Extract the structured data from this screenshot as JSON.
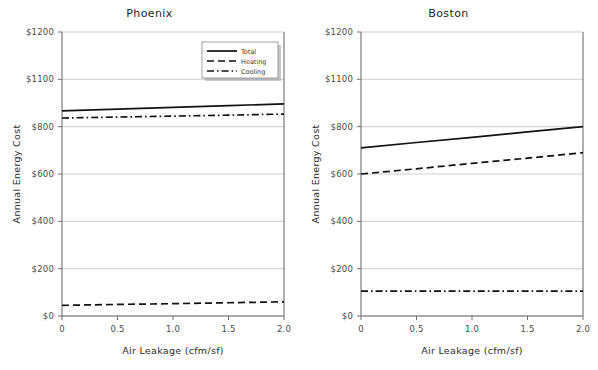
{
  "chart_data": [
    {
      "type": "line",
      "title": "Phoenix",
      "xlabel": "Air Leakage (cfm/sf)",
      "ylabel": "Annual Energy Cost",
      "x": [
        0,
        0.5,
        1.0,
        1.5,
        2.0
      ],
      "xlim": [
        0,
        2.0
      ],
      "xticks": [
        0,
        0.5,
        1.0,
        1.5,
        2.0
      ],
      "xticklabels": [
        "0",
        "0.5",
        "1.0",
        "1.5",
        "2.0"
      ],
      "yticks": [
        1200,
        1100,
        800,
        600,
        400,
        200,
        0
      ],
      "yticklabels": [
        "$1200",
        "$1100",
        "$800",
        "$600",
        "$400",
        "$200",
        "$0"
      ],
      "grid": true,
      "legend": "upper right",
      "series": [
        {
          "name": "Total",
          "style": "solid",
          "values": [
            900,
            911,
            922,
            933,
            945
          ]
        },
        {
          "name": "Heating",
          "style": "dashed",
          "values": [
            45,
            49,
            52,
            56,
            60
          ]
        },
        {
          "name": "Cooling",
          "style": "dashdot",
          "values": [
            855,
            861,
            867,
            873,
            880
          ]
        }
      ]
    },
    {
      "type": "line",
      "title": "Boston",
      "xlabel": "Air Leakage (cfm/sf)",
      "ylabel": "Annual Energy Cost",
      "x": [
        0,
        0.5,
        1.0,
        1.5,
        2.0
      ],
      "xlim": [
        0,
        2.0
      ],
      "xticks": [
        0,
        0.5,
        1.0,
        1.5,
        2.0
      ],
      "xticklabels": [
        "0",
        "0.5",
        "1.0",
        "1.5",
        "2.0"
      ],
      "yticks": [
        1200,
        1100,
        800,
        600,
        400,
        200,
        0
      ],
      "yticklabels": [
        "$1200",
        "$1100",
        "$800",
        "$600",
        "$400",
        "$200",
        "$0"
      ],
      "grid": true,
      "legend": "upper right",
      "series": [
        {
          "name": "Total",
          "style": "solid",
          "values": [
            710,
            733,
            755,
            778,
            800
          ]
        },
        {
          "name": "Heating",
          "style": "dashed",
          "values": [
            600,
            622,
            645,
            667,
            690
          ]
        },
        {
          "name": "Cooling",
          "style": "dashdot",
          "values": [
            105,
            105,
            105,
            105,
            105
          ]
        }
      ]
    }
  ],
  "legend": {
    "entries": [
      {
        "label": "Total",
        "style": "solid"
      },
      {
        "label": "Heating",
        "style": "dashed"
      },
      {
        "label": "Cooling",
        "style": "dashdot"
      }
    ]
  },
  "colors": {
    "line": "#111111",
    "grid": "#b9b9b9",
    "axis": "#6f6f6f",
    "text": "#3a3a3a",
    "background": "#ffffff"
  }
}
